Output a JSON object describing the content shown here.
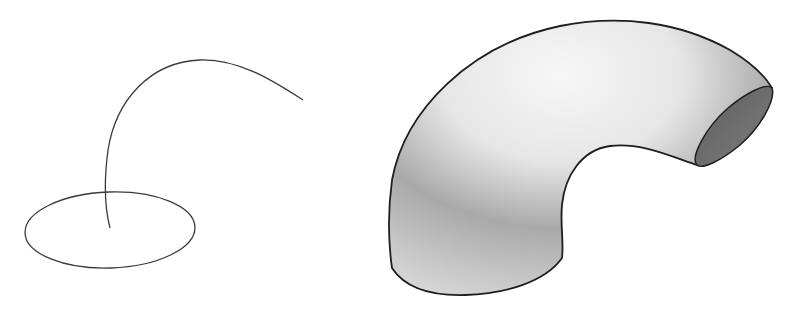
{
  "diagram": {
    "type": "sweep-illustration",
    "panels": [
      {
        "id": "input",
        "elements": [
          {
            "kind": "profile",
            "shape": "ellipse",
            "center": [
              110,
              230
            ],
            "rx": 85,
            "ry": 38
          },
          {
            "kind": "path",
            "shape": "curve",
            "start": [
              110,
              228
            ],
            "end": [
              303,
              100
            ]
          }
        ]
      },
      {
        "id": "result",
        "elements": [
          {
            "kind": "swept-solid",
            "shape": "bent-tube"
          }
        ]
      }
    ],
    "colors": {
      "background": "#ffffff",
      "stroke": "#2a2a2a",
      "tube_light": "#f2f2f2",
      "tube_mid": "#c8c8c8",
      "tube_dark": "#8a8a8a",
      "end_cap": "#6f6f6f"
    }
  }
}
